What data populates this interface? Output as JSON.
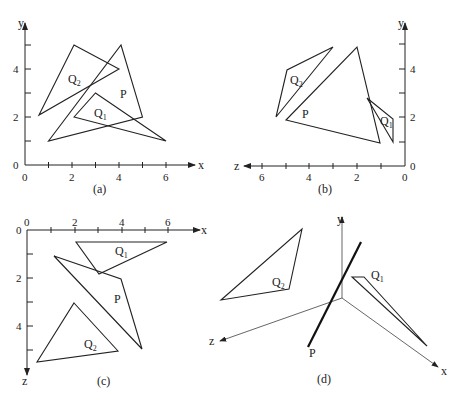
{
  "figure": {
    "panels": [
      {
        "id": "a",
        "caption": "(a)",
        "view": "x-y projection",
        "axes": {
          "horizontal": "x",
          "vertical": "y"
        },
        "x_ticks": [
          "0",
          "2",
          "4",
          "6"
        ],
        "y_ticks": [
          "0",
          "2",
          "4"
        ],
        "labels": {
          "P": "P",
          "Q1": "Q",
          "Q1_sub": "1",
          "Q2": "Q",
          "Q2_sub": "2"
        }
      },
      {
        "id": "b",
        "caption": "(b)",
        "view": "z-y projection",
        "axes": {
          "horizontal": "z",
          "vertical": "y"
        },
        "z_ticks": [
          "0",
          "2",
          "4",
          "6"
        ],
        "y_ticks": [
          "0",
          "2",
          "4"
        ],
        "labels": {
          "P": "P",
          "Q1": "Q",
          "Q1_sub": "1",
          "Q2": "Q",
          "Q2_sub": "2"
        }
      },
      {
        "id": "c",
        "caption": "(c)",
        "view": "x-z projection",
        "axes": {
          "horizontal": "x",
          "vertical": "z"
        },
        "x_ticks": [
          "0",
          "2",
          "4",
          "6"
        ],
        "z_ticks": [
          "0",
          "2",
          "4"
        ],
        "labels": {
          "P": "P",
          "Q1": "Q",
          "Q1_sub": "1",
          "Q2": "Q",
          "Q2_sub": "2"
        }
      },
      {
        "id": "d",
        "caption": "(d)",
        "view": "3D view, P seen edge-on",
        "axes": {
          "x": "x",
          "y": "y",
          "z": "z"
        },
        "labels": {
          "P": "P",
          "Q1": "Q",
          "Q1_sub": "1",
          "Q2": "Q",
          "Q2_sub": "2"
        }
      }
    ]
  }
}
